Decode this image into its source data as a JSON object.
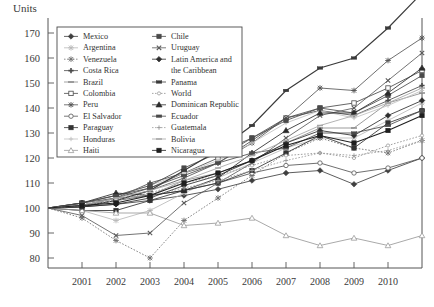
{
  "axis_title": "Units",
  "chart_data": {
    "type": "line",
    "title": "",
    "subtitle": "",
    "xlabel": "",
    "ylabel": "Units",
    "x": [
      2000,
      2001,
      2002,
      2003,
      2004,
      2005,
      2006,
      2007,
      2008,
      2009,
      2010,
      2011
    ],
    "xticks": [
      "2001",
      "2002",
      "2003",
      "2004",
      "2005",
      "2006",
      "2007",
      "2008",
      "2009",
      "2010"
    ],
    "yticks": [
      80,
      90,
      100,
      110,
      120,
      130,
      140,
      150,
      160,
      170
    ],
    "ylim": [
      76,
      176
    ],
    "xlim": [
      2000,
      2011
    ],
    "grid": false,
    "legend_position": "upper-left-inside",
    "series": [
      {
        "name": "Mexico",
        "marker": "diamond-filled",
        "dash": "solid",
        "color": "#3f3f3f",
        "values": [
          100,
          100.5,
          101.5,
          103,
          105,
          107.5,
          111,
          114,
          115,
          109.5,
          115,
          120
        ]
      },
      {
        "name": "Argentina",
        "marker": "star",
        "dash": "solid",
        "color": "#b9b9b9",
        "values": [
          100,
          99,
          95,
          99,
          106,
          112,
          118,
          124,
          128,
          128,
          135,
          142
        ]
      },
      {
        "name": "Venezuela",
        "marker": "asterisk",
        "dash": "dotted",
        "color": "#707070",
        "values": [
          100,
          96,
          87,
          80,
          95,
          104,
          113,
          122,
          128,
          124,
          122,
          127
        ]
      },
      {
        "name": "Costa Rica",
        "marker": "plus-filled",
        "dash": "solid",
        "color": "#4a4a4a",
        "values": [
          100,
          101,
          104,
          110,
          114,
          118,
          127,
          136,
          139,
          137,
          143,
          149
        ]
      },
      {
        "name": "Brazil",
        "marker": "dash",
        "dash": "solid",
        "color": "#8a8a8a",
        "values": [
          100,
          101,
          104,
          105,
          111,
          114,
          119,
          126,
          132,
          132,
          142,
          146
        ]
      },
      {
        "name": "Colombia",
        "marker": "square-open",
        "dash": "solid",
        "color": "#4a4a4a",
        "values": [
          100,
          102,
          104,
          108,
          114,
          120,
          128,
          136,
          140,
          142,
          148,
          155
        ]
      },
      {
        "name": "Peru",
        "marker": "sun",
        "dash": "solid",
        "color": "#555555",
        "values": [
          100,
          100.5,
          103,
          107,
          112,
          118,
          126,
          136,
          148,
          147,
          159,
          168
        ]
      },
      {
        "name": "El Salvador",
        "marker": "circle-open",
        "dash": "solid",
        "color": "#555555",
        "values": [
          100,
          101,
          103,
          105,
          107,
          110,
          114,
          117,
          118,
          114,
          116,
          120
        ]
      },
      {
        "name": "Paraguay",
        "marker": "square-filled",
        "dash": "solid",
        "color": "#333333",
        "values": [
          100,
          99,
          99,
          103,
          107,
          110,
          115,
          122,
          129,
          124,
          134,
          139
        ]
      },
      {
        "name": "Honduras",
        "marker": "cross-light",
        "dash": "solid",
        "color": "#c0c0c0",
        "values": [
          100,
          102,
          105,
          109,
          114,
          119,
          126,
          134,
          139,
          136,
          141,
          147
        ]
      },
      {
        "name": "Haiti",
        "marker": "triangle-open",
        "dash": "solid",
        "color": "#9a9a9a",
        "values": [
          100,
          99,
          98,
          98,
          93,
          94,
          96,
          89,
          85,
          88,
          85,
          89
        ]
      },
      {
        "name": "Chile",
        "marker": "square-dot",
        "dash": "solid",
        "color": "#4a4a4a",
        "values": [
          100,
          102,
          105,
          109,
          116,
          122,
          128,
          135,
          140,
          138,
          145,
          153
        ]
      },
      {
        "name": "Uruguay",
        "marker": "x-mark",
        "dash": "solid",
        "color": "#5a5a5a",
        "values": [
          100,
          97,
          89,
          90,
          102,
          110,
          118,
          128,
          137,
          140,
          151,
          162
        ]
      },
      {
        "name": "Latin America and the Caribbean",
        "marker": "diamond-dark",
        "dash": "solid",
        "color": "#2e2e2e",
        "values": [
          100,
          100.5,
          101.5,
          104,
          109,
          113,
          119,
          126,
          131,
          129,
          137,
          143
        ]
      },
      {
        "name": "Panama",
        "marker": "bar-thick",
        "dash": "solid",
        "color": "#3a3a3a",
        "values": [
          100,
          100.5,
          103,
          107,
          115,
          123,
          133,
          147,
          156,
          160,
          172,
          186
        ]
      },
      {
        "name": "World",
        "marker": "circle-tiny",
        "dash": "dotted",
        "color": "#8f8f8f",
        "values": [
          100,
          101.5,
          103.5,
          106,
          110,
          113,
          117,
          121,
          122,
          120,
          125,
          129
        ]
      },
      {
        "name": "Dominican Republic",
        "marker": "triangle-filled",
        "dash": "solid",
        "color": "#2b2b2b",
        "values": [
          100,
          102,
          106,
          105,
          107,
          112,
          122,
          131,
          138,
          138,
          146,
          156
        ]
      },
      {
        "name": "Ecuador",
        "marker": "bar-med",
        "dash": "solid",
        "color": "#4a4a4a",
        "values": [
          100,
          102,
          105,
          108,
          113,
          118,
          122,
          124,
          130,
          130,
          133,
          139
        ]
      },
      {
        "name": "Guatemala",
        "marker": "plus-small",
        "dash": "dotted",
        "color": "#9a9a9a",
        "values": [
          100,
          101,
          103,
          105,
          108,
          111,
          115,
          119,
          122,
          121,
          123,
          127
        ]
      },
      {
        "name": "Bolivia",
        "marker": "dash-light",
        "dash": "solid",
        "color": "#a5a5a5",
        "values": [
          100,
          101,
          104,
          107,
          111,
          116,
          121,
          127,
          133,
          137,
          142,
          148
        ]
      },
      {
        "name": "Nicaragua",
        "marker": "square-bold",
        "dash": "solid",
        "color": "#1f1f1f",
        "values": [
          100,
          101,
          102,
          105,
          110,
          114,
          119,
          125,
          129,
          126,
          131,
          137
        ]
      }
    ]
  },
  "legend": {
    "columns": [
      [
        "Mexico",
        "Argentina",
        "Venezuela",
        "Costa Rica",
        "Brazil",
        "Colombia",
        "Peru",
        "El Salvador",
        "Paraguay",
        "Honduras",
        "Haiti"
      ],
      [
        "Chile",
        "Uruguay",
        "Latin America and the Caribbean",
        "Panama",
        "World",
        "Dominican Republic",
        "Ecuador",
        "Guatemala",
        "Bolivia",
        "Nicaragua"
      ]
    ]
  }
}
